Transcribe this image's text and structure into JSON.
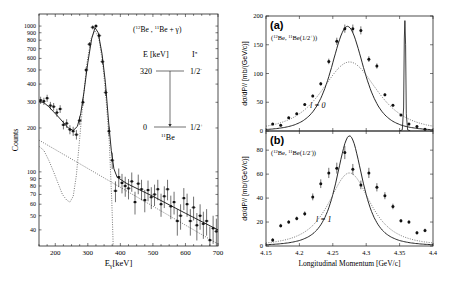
{
  "chart_data": [
    {
      "id": "left",
      "type": "scatter",
      "title": "",
      "annotation": "(12Be , 11Be + γ)",
      "xlabel": "Eγ [keV]",
      "ylabel": "Counts",
      "xlim": [
        150,
        700
      ],
      "ylim": [
        31,
        1210
      ],
      "yscale": "log",
      "xticks": [
        200,
        300,
        400,
        500,
        600,
        700
      ],
      "yticks": [
        40,
        50,
        60,
        70,
        80,
        90,
        100,
        200,
        300,
        400,
        500,
        600,
        700,
        800,
        900,
        1000
      ],
      "grid": false,
      "series": [
        {
          "name": "data",
          "style": "points-with-errorbars",
          "x": [
            155,
            165,
            175,
            185,
            195,
            205,
            215,
            225,
            235,
            245,
            255,
            265,
            275,
            285,
            295,
            305,
            315,
            325,
            335,
            345,
            355,
            365,
            375,
            385,
            395,
            405,
            415,
            425,
            435,
            445,
            455,
            465,
            475,
            485,
            495,
            505,
            515,
            525,
            535,
            545,
            555,
            565,
            575,
            585,
            595,
            605,
            615,
            625,
            635,
            645,
            655,
            665,
            675,
            685,
            695
          ],
          "y": [
            310,
            305,
            320,
            285,
            280,
            255,
            270,
            210,
            215,
            195,
            190,
            180,
            225,
            300,
            500,
            750,
            980,
            1000,
            860,
            570,
            350,
            190,
            120,
            74,
            92,
            84,
            80,
            77,
            86,
            62,
            83,
            76,
            64,
            75,
            67,
            70,
            76,
            60,
            68,
            76,
            58,
            62,
            46,
            50,
            66,
            60,
            46,
            57,
            43,
            50,
            44,
            46,
            34,
            41,
            39
          ]
        },
        {
          "name": "total fit",
          "style": "solid-line"
        },
        {
          "name": "background (exponential)",
          "style": "dotted-line",
          "x": [
            150,
            700
          ],
          "y": [
            165,
            32
          ]
        },
        {
          "name": "320 keV line response",
          "style": "dotted-line"
        }
      ],
      "level_scheme": {
        "header_energy": "E [keV]",
        "header_spin": "Iπ",
        "levels": [
          {
            "energy": "320",
            "spin": "1/2-"
          },
          {
            "energy": "0",
            "spin": "1/2+"
          }
        ],
        "nucleus": "11Be"
      }
    },
    {
      "id": "right-a",
      "type": "scatter",
      "panel_label": "(a)",
      "annotation": "(12Be, 11Be(1/2+))",
      "l_label": "l = 0",
      "xlabel": "",
      "ylabel": "dσ/dP// [mb/(GeV/c)]",
      "xlim": [
        4.15,
        4.4
      ],
      "ylim": [
        0,
        200
      ],
      "yticks": [
        0,
        50,
        100,
        150,
        200
      ],
      "series": [
        {
          "name": "data",
          "style": "points-with-errorbars",
          "x": [
            4.16,
            4.172,
            4.184,
            4.196,
            4.208,
            4.22,
            4.232,
            4.244,
            4.256,
            4.268,
            4.28,
            4.292,
            4.304,
            4.316,
            4.328,
            4.34,
            4.352,
            4.364,
            4.376,
            4.388
          ],
          "y": [
            12,
            10,
            23,
            30,
            46,
            61,
            82,
            121,
            156,
            178,
            178,
            175,
            125,
            113,
            63,
            45,
            28,
            12,
            8,
            3
          ]
        },
        {
          "name": "l=0 calc (solid)",
          "style": "solid-line",
          "peak": 182,
          "center": 4.272
        },
        {
          "name": "dotted calc",
          "style": "dotted-line",
          "peak": 120,
          "center": 4.275
        },
        {
          "name": "narrow peak",
          "style": "solid-line",
          "center": 4.358,
          "peak": 192
        }
      ]
    },
    {
      "id": "right-b",
      "type": "scatter",
      "panel_label": "(b)",
      "annotation": "(12Be, 11Be(1/2-))",
      "l_label": "l = 1",
      "xlabel": "Longitudinal Momentum [GeV/c]",
      "ylabel": "dσ/dP// [mb/(GeV/c)]",
      "xlim": [
        4.15,
        4.4
      ],
      "ylim": [
        0,
        96
      ],
      "xticks": [
        4.15,
        4.2,
        4.25,
        4.3,
        4.35,
        4.4
      ],
      "xticklabels": [
        "4.15",
        "4.2",
        "4.25",
        "4.3",
        "4.35",
        "4.4"
      ],
      "yticks": [
        0,
        20,
        40,
        60,
        80
      ],
      "series": [
        {
          "name": "data",
          "style": "points-with-errorbars",
          "x": [
            4.16,
            4.172,
            4.184,
            4.196,
            4.208,
            4.22,
            4.232,
            4.244,
            4.256,
            4.268,
            4.28,
            4.292,
            4.304,
            4.316,
            4.328,
            4.34,
            4.352,
            4.364,
            4.376,
            4.388
          ],
          "y": [
            5,
            17,
            20,
            23,
            27,
            41,
            52,
            61,
            65,
            78,
            64,
            51,
            61,
            49,
            42,
            33,
            21,
            20,
            11,
            13
          ]
        },
        {
          "name": "l=1 calc (solid)",
          "style": "solid-line",
          "peak": 92,
          "center": 4.275
        },
        {
          "name": "dotted calc",
          "style": "dotted-line",
          "peak": 61,
          "center": 4.275
        }
      ]
    }
  ]
}
